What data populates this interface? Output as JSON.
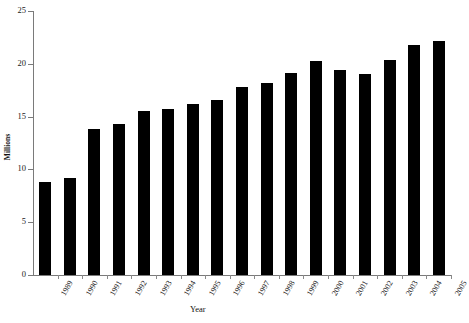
{
  "chart_data": {
    "type": "bar",
    "title": "",
    "xlabel": "Year",
    "ylabel": "Millions",
    "ylim": [
      0,
      25
    ],
    "yticks": [
      0,
      5,
      10,
      15,
      20,
      25
    ],
    "grid": false,
    "legend": "none",
    "bar_color": "#000000",
    "axis_color": "#7a7a7a",
    "categories": [
      "1989",
      "1990",
      "1991",
      "1992",
      "1993",
      "1994",
      "1995",
      "1996",
      "1997",
      "1998",
      "1999",
      "2000",
      "2001",
      "2002",
      "2003",
      "2004",
      "2005"
    ],
    "values": [
      8.8,
      9.2,
      13.8,
      14.3,
      15.5,
      15.7,
      16.2,
      16.6,
      17.8,
      18.2,
      19.1,
      20.3,
      19.4,
      19.0,
      20.4,
      21.8,
      22.2
    ]
  }
}
